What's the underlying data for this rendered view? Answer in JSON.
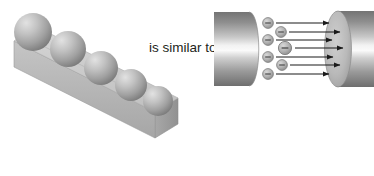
{
  "figure": {
    "caption_text": "is similar to",
    "background_color": "#ffffff",
    "panels": {
      "left": {
        "name": "ball-and-bar-model",
        "description": "Gray three-dimensional rectangular bar shown in oblique projection with five gray spheres resting in a row along its top face",
        "bar_color_top": "#c9c9c9",
        "bar_color_front": "#b6b6b6",
        "bar_color_end": "#9d9d9d",
        "sphere_color_light": "#d4d4d4",
        "sphere_color_dark": "#8a8a8a",
        "sphere_count": 5,
        "spheres": [
          {
            "label": "sphere-1",
            "cx": 33,
            "cy": 32,
            "r": 19
          },
          {
            "label": "sphere-2",
            "cx": 68,
            "cy": 49,
            "r": 18
          },
          {
            "label": "sphere-3",
            "cx": 101,
            "cy": 68,
            "r": 17
          },
          {
            "label": "sphere-4",
            "cx": 131,
            "cy": 85,
            "r": 16
          },
          {
            "label": "sphere-5",
            "cx": 158,
            "cy": 101,
            "r": 15
          }
        ]
      },
      "right": {
        "name": "electron-transfer-diagram",
        "description": "Two gray cylinders facing each other with negatively charged particles moving from the left cylinder to the right cylinder along horizontal arrows",
        "cylinder_color_light": "#e8e8e8",
        "cylinder_color_dark": "#7f7f7f",
        "cylinder_face_color": "#b9b9b9",
        "arrow_color": "#1a1a1a",
        "particle_symbol": "−",
        "particle_color": "#9a9a9a",
        "particle_count": 9,
        "left_cylinder_label": "left-cylinder",
        "right_cylinder_label": "right-cylinder",
        "particles": [
          {
            "label": "electron-1",
            "cx": 268,
            "cy": 23,
            "r": 5.5,
            "arrow_x1": 276,
            "arrow_x2": 330,
            "arrow_y": 23
          },
          {
            "label": "electron-2",
            "cx": 281,
            "cy": 32,
            "r": 5.5,
            "arrow_x1": 289,
            "arrow_x2": 341,
            "arrow_y": 32
          },
          {
            "label": "electron-3",
            "cx": 268,
            "cy": 40,
            "r": 5.5,
            "arrow_x1": 276,
            "arrow_x2": 333,
            "arrow_y": 40
          },
          {
            "label": "electron-4",
            "cx": 285,
            "cy": 48,
            "r": 6.5,
            "arrow_x1": 294,
            "arrow_x2": 344,
            "arrow_y": 48
          },
          {
            "label": "electron-5",
            "cx": 268,
            "cy": 57,
            "r": 5.5,
            "arrow_x1": 276,
            "arrow_x2": 334,
            "arrow_y": 57
          },
          {
            "label": "electron-6",
            "cx": 282,
            "cy": 65,
            "r": 5.5,
            "arrow_x1": 290,
            "arrow_x2": 341,
            "arrow_y": 65
          },
          {
            "label": "electron-7",
            "cx": 268,
            "cy": 74,
            "r": 5.5,
            "arrow_x1": 276,
            "arrow_x2": 330,
            "arrow_y": 74
          }
        ]
      }
    }
  }
}
